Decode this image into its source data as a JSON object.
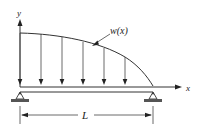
{
  "diagram": {
    "labels": {
      "y_axis": "y",
      "x_axis": "x",
      "load": "w(x)",
      "length": "L"
    },
    "load_arrows_count": 6,
    "supports": [
      "pin-left",
      "pin-right"
    ],
    "colors": {
      "line": "#333333",
      "background": "#ffffff"
    }
  }
}
